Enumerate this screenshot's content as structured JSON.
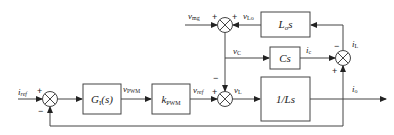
{
  "diagram": {
    "type": "control block diagram",
    "blocks": [
      {
        "id": "gi",
        "label": "G",
        "sub": "I",
        "suffix": "(s)"
      },
      {
        "id": "kpwm",
        "label": "k",
        "sub": "PWM"
      },
      {
        "id": "los",
        "label": "L",
        "sub": "o",
        "suffix": "s"
      },
      {
        "id": "cs",
        "label": "Cs"
      },
      {
        "id": "invls",
        "label": "1/Ls"
      }
    ],
    "signals": {
      "iref": {
        "main": "i",
        "sub": "ref"
      },
      "vpwm": {
        "main": "v",
        "sub": "PWM"
      },
      "vref": {
        "main": "v",
        "sub": "ref"
      },
      "vl": {
        "main": "v",
        "sub": "L"
      },
      "vmg": {
        "main": "v",
        "sub": "mg"
      },
      "vlo": {
        "main": "v",
        "sub": "Lo"
      },
      "vc": {
        "main": "v",
        "sub": "C"
      },
      "ic": {
        "main": "i",
        "sub": "c"
      },
      "il": {
        "main": "i",
        "sub": "L"
      },
      "io": {
        "main": "i",
        "sub": "o"
      }
    },
    "signs": {
      "plus": "+",
      "minus": "−"
    }
  }
}
